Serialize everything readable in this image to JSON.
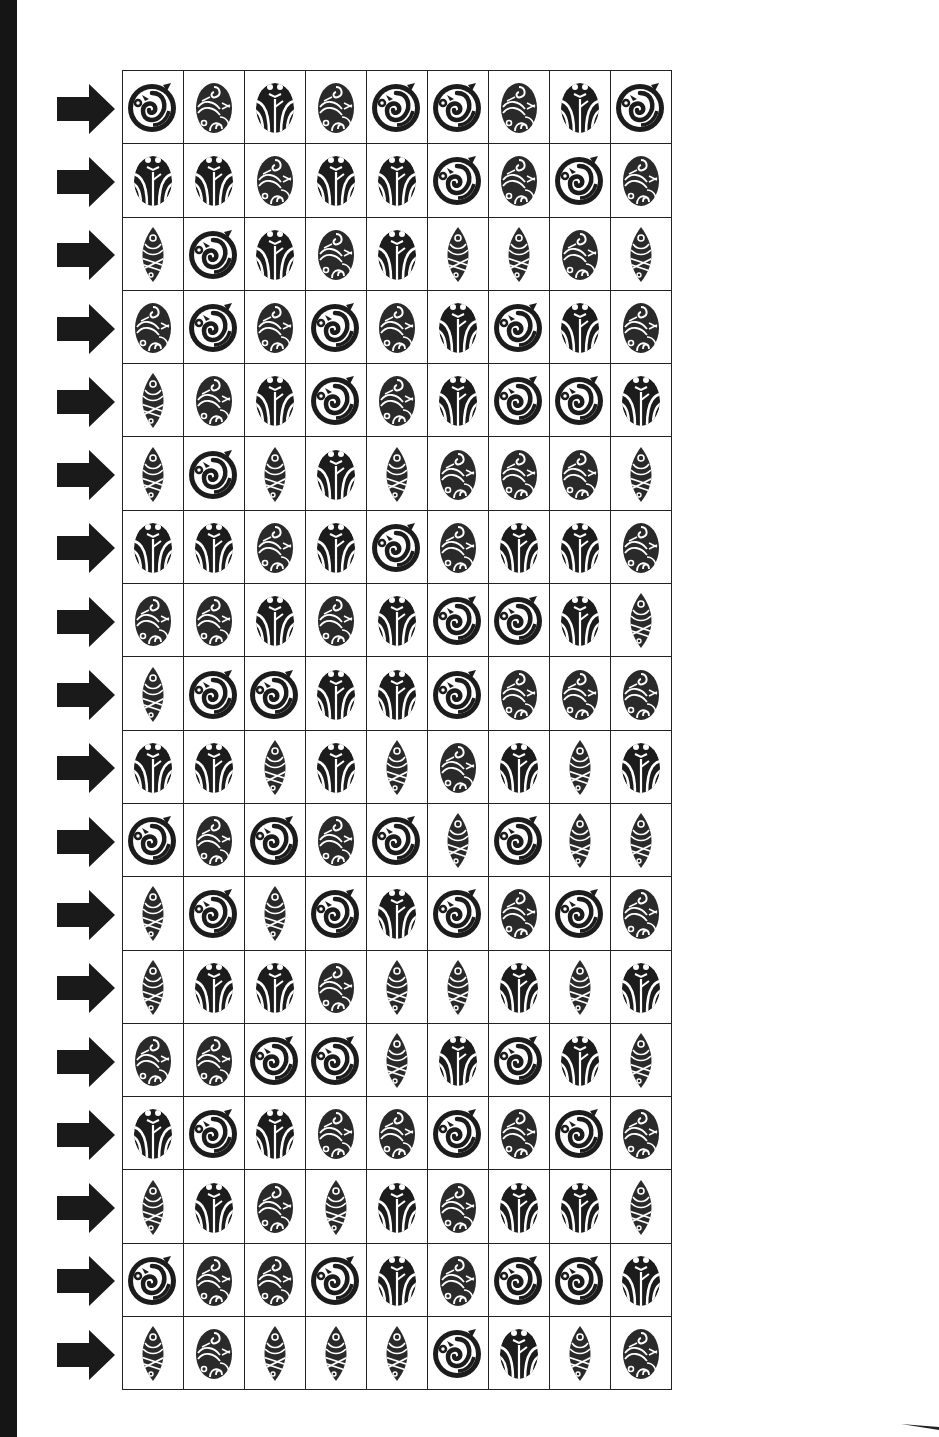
{
  "page": {
    "background": "#ffffff",
    "ink_color": "#222222",
    "binding_bar_color": "#151515"
  },
  "legend": {
    "A": "circle-spiral-symbol",
    "B": "egg-swirl-pattern-symbol",
    "C": "face-branch-symbol",
    "D": "leaf-twist-symbol"
  },
  "grid": {
    "rows": 18,
    "columns": 9,
    "row_marker": "right-arrow",
    "cells": [
      [
        "A",
        "B",
        "C",
        "B",
        "A",
        "A",
        "B",
        "C",
        "A"
      ],
      [
        "C",
        "C",
        "B",
        "C",
        "C",
        "A",
        "B",
        "A",
        "B"
      ],
      [
        "D",
        "A",
        "C",
        "B",
        "C",
        "D",
        "D",
        "B",
        "D"
      ],
      [
        "B",
        "A",
        "B",
        "A",
        "B",
        "C",
        "A",
        "C",
        "B"
      ],
      [
        "D",
        "B",
        "C",
        "A",
        "B",
        "C",
        "A",
        "A",
        "C"
      ],
      [
        "D",
        "A",
        "D",
        "C",
        "D",
        "B",
        "B",
        "B",
        "D"
      ],
      [
        "C",
        "C",
        "B",
        "C",
        "A",
        "B",
        "C",
        "C",
        "B"
      ],
      [
        "B",
        "B",
        "C",
        "B",
        "C",
        "A",
        "A",
        "C",
        "D"
      ],
      [
        "D",
        "A",
        "A",
        "C",
        "C",
        "A",
        "B",
        "B",
        "B"
      ],
      [
        "C",
        "C",
        "D",
        "C",
        "D",
        "B",
        "C",
        "D",
        "C"
      ],
      [
        "A",
        "B",
        "A",
        "B",
        "A",
        "D",
        "A",
        "D",
        "D"
      ],
      [
        "D",
        "A",
        "D",
        "A",
        "C",
        "A",
        "B",
        "A",
        "B"
      ],
      [
        "D",
        "C",
        "C",
        "B",
        "D",
        "D",
        "C",
        "D",
        "C"
      ],
      [
        "B",
        "B",
        "A",
        "A",
        "D",
        "C",
        "A",
        "C",
        "D"
      ],
      [
        "C",
        "A",
        "C",
        "B",
        "B",
        "A",
        "B",
        "A",
        "B"
      ],
      [
        "D",
        "C",
        "B",
        "D",
        "C",
        "B",
        "C",
        "C",
        "D"
      ],
      [
        "A",
        "B",
        "B",
        "A",
        "C",
        "B",
        "A",
        "A",
        "C"
      ],
      [
        "D",
        "B",
        "D",
        "D",
        "D",
        "A",
        "C",
        "D",
        "B"
      ]
    ]
  }
}
